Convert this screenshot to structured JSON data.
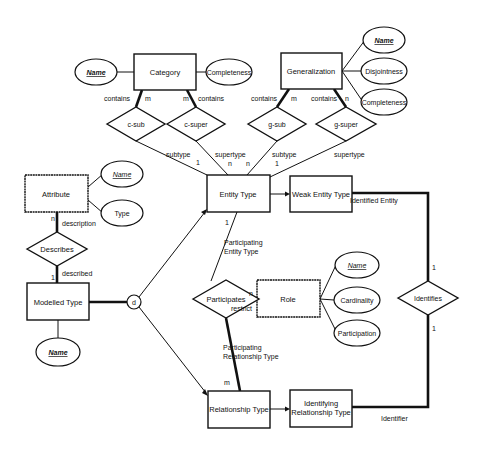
{
  "diagram": {
    "type": "entity-relationship",
    "entities": {
      "category": "Category",
      "generalization": "Generalization",
      "entity_type": "Entity Type",
      "weak_entity_type": "Weak Entity Type",
      "attribute": "Attribute",
      "modelled_type": "Modelled Type",
      "role": "Role",
      "relationship_type": "Relationship Type",
      "identifying_relationship_type_1": "Identifying",
      "identifying_relationship_type_2": "Relationship Type"
    },
    "relationships": {
      "c_sub": "c-sub",
      "c_super": "c-super",
      "g_sub": "g-sub",
      "g_super": "g-super",
      "describes": "Describes",
      "participates": "Participates",
      "identifies": "Identifies"
    },
    "attributes": {
      "category_name": "Name",
      "category_completeness": "Completeness",
      "gen_name": "Name",
      "gen_disjointness": "Disjointness",
      "gen_completeness": "Completeness",
      "attr_name": "Name",
      "attr_type": "Type",
      "modelled_name": "Name",
      "role_name": "Name",
      "role_cardinality": "Cardinality",
      "role_participation": "Participation"
    },
    "disjoint_symbol": "d",
    "labels": {
      "contains": "contains",
      "subtype": "subtype",
      "supertype": "supertype",
      "description": "description",
      "described": "described",
      "restrict": "restrict",
      "participating_entity_1": "Participating",
      "participating_entity_2": "Entity Type",
      "participating_rel_1": "Participating",
      "participating_rel_2": "Relationship Type",
      "identified_entity": "Identified Entity",
      "identifier": "Identifier"
    },
    "cardinalities": {
      "m": "m",
      "n": "n",
      "one": "1"
    }
  }
}
